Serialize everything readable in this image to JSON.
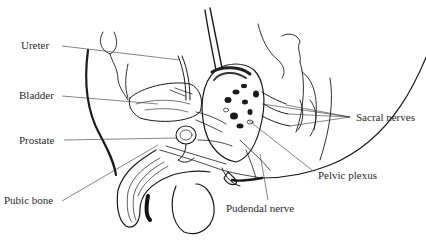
{
  "diagram": {
    "labels": {
      "ureter": "Ureter",
      "bladder": "Bladder",
      "prostate": "Prostate",
      "pubic_bone": "Pubic bone",
      "sacral_nerves": "Sacral nerves",
      "pelvic_plexus": "Pelvic plexus",
      "pudendal_nerve": "Pudendal nerve"
    },
    "colors": {
      "ink": "#1a1a1a",
      "label": "#2a2a2a",
      "background": "#ffffff"
    }
  }
}
